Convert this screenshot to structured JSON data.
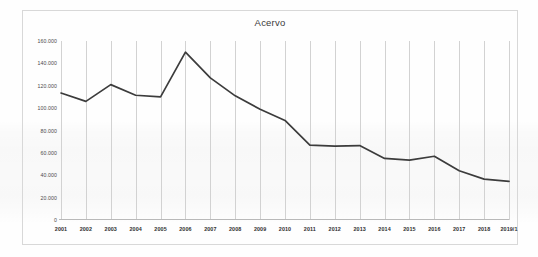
{
  "chart_data": {
    "type": "line",
    "title": "Acervo",
    "xlabel": "",
    "ylabel": "",
    "categories": [
      "2001",
      "2002",
      "2003",
      "2004",
      "2005",
      "2006",
      "2007",
      "2008",
      "2009",
      "2010",
      "2011",
      "2012",
      "2013",
      "2014",
      "2015",
      "2016",
      "2017",
      "2018",
      "2019/1"
    ],
    "values": [
      113500,
      106000,
      121000,
      111500,
      110000,
      150000,
      127000,
      111000,
      99000,
      89000,
      67000,
      66000,
      66500,
      55000,
      53500,
      57000,
      44000,
      36500,
      34500
    ],
    "series": [
      {
        "name": "Acervo",
        "values": [
          113500,
          106000,
          121000,
          111500,
          110000,
          150000,
          127000,
          111000,
          99000,
          89000,
          67000,
          66000,
          66500,
          55000,
          53500,
          57000,
          44000,
          36500,
          34500
        ]
      }
    ],
    "ylim": [
      0,
      160000
    ],
    "yticks": [
      0,
      20000,
      40000,
      60000,
      80000,
      100000,
      120000,
      140000,
      160000
    ],
    "ytick_labels": [
      "0",
      "20.000",
      "40.000",
      "60.000",
      "80.000",
      "100.000",
      "120.000",
      "140.000",
      "160.000"
    ],
    "grid": "vertical-only",
    "legend": "none",
    "line_color": "#3c3c3c"
  },
  "colors": {
    "line": "#3c3c3c",
    "gridline": "#d2d2d2",
    "frame_border": "#d8d8d8",
    "axis": "#b9b9b9",
    "title_text": "#3a3a3a",
    "ytick_text": "#4a4a4a",
    "xtick_text": "#2f2f2f",
    "background": "#fefefe"
  }
}
